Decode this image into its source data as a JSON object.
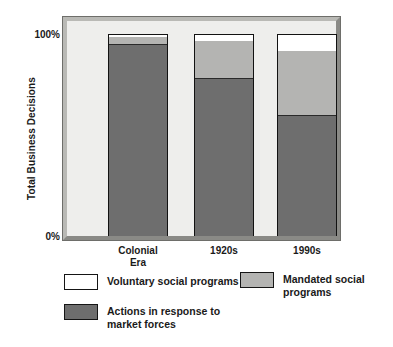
{
  "chart_data": {
    "type": "bar",
    "subtype": "stacked-100-percent",
    "title": "",
    "xlabel": "",
    "ylabel": "Total Business Decisions",
    "categories": [
      "Colonial\nEra",
      "1920s",
      "1990s"
    ],
    "ytick_labels": [
      "100%",
      "0%"
    ],
    "ylim": [
      0,
      100
    ],
    "grid": false,
    "legend_position": "below-plot",
    "series": [
      {
        "name": "Actions in response to\nmarket forces",
        "color": "#6e6e6e",
        "values": [
          95,
          78,
          60
        ]
      },
      {
        "name": "Mandated social\nprograms",
        "color": "#b4b4b2",
        "values": [
          4,
          19,
          32
        ]
      },
      {
        "name": "Voluntary social programs",
        "color": "#ffffff",
        "values": [
          1,
          3,
          8
        ]
      }
    ]
  },
  "axis": {
    "y_title": "Total Business Decisions",
    "y_top_tick": "100%",
    "y_bottom_tick": "0%"
  },
  "categories": [
    {
      "label": "Colonial\nEra"
    },
    {
      "label": "1920s"
    },
    {
      "label": "1990s"
    }
  ],
  "bars": [
    {
      "category": "Colonial Era",
      "voluntary_pct": 1,
      "mandated_pct": 4,
      "market_pct": 95
    },
    {
      "category": "1920s",
      "voluntary_pct": 3,
      "mandated_pct": 19,
      "market_pct": 78
    },
    {
      "category": "1990s",
      "voluntary_pct": 8,
      "mandated_pct": 32,
      "market_pct": 60
    }
  ],
  "legend": {
    "voluntary": {
      "label": "Voluntary social programs",
      "color": "#ffffff"
    },
    "mandated": {
      "label": "Mandated social\nprograms",
      "color": "#b4b4b2"
    },
    "market": {
      "label": "Actions in response to\nmarket forces",
      "color": "#6e6e6e"
    }
  }
}
